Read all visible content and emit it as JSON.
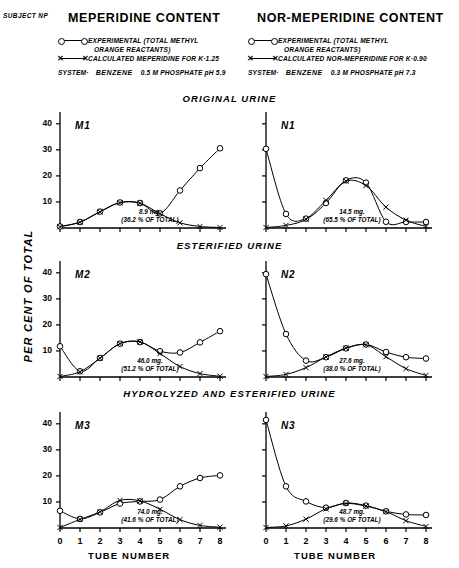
{
  "header": {
    "subject": "SUBJECT NP",
    "left_title": "MEPERIDINE CONTENT",
    "right_title": "NOR-MEPERIDINE CONTENT"
  },
  "legend_left": {
    "exp_line1": "EXPERIMENTAL (TOTAL METHYL",
    "exp_line2": "ORANGE REACTANTS)",
    "calc": "CALCULATED MEPERIDINE FOR K·1.25",
    "system_label": "SYSTEM·",
    "system_numerator": "BENZENE",
    "system_denominator": "0.5 M PHOSPHATE pH 5.9"
  },
  "legend_right": {
    "exp_line1": "EXPERIMENTAL (TOTAL METHYL",
    "exp_line2": "ORANGE REACTANTS)",
    "calc": "CALCULATED NOR-MEPERIDINE FOR K·0.90",
    "system_label": "SYSTEM·",
    "system_numerator": "BENZENE",
    "system_denominator": "0.3 M PHOSPHATE pH 7.3"
  },
  "sections": [
    "ORIGINAL URINE",
    "ESTERIFIED URINE",
    "HYDROLYZED AND ESTERIFIED URINE"
  ],
  "axes": {
    "ylabel": "PER CENT OF TOTAL",
    "xlabel": "TUBE NUMBER",
    "yticks": [
      "40",
      "30",
      "20",
      "10"
    ],
    "xticks": [
      "0",
      "1",
      "2",
      "3",
      "4",
      "5",
      "6",
      "7",
      "8"
    ]
  },
  "chart_data": {
    "type": "line",
    "xlabel": "TUBE NUMBER",
    "ylabel": "PER CENT OF TOTAL",
    "xlim": [
      0,
      8
    ],
    "ylim": [
      0,
      43
    ],
    "grid": false,
    "legend_position": "top",
    "panels": [
      {
        "id": "M1",
        "label": "M1",
        "column": "MEPERIDINE CONTENT",
        "row": "ORIGINAL URINE",
        "annotation_mg": "8.9 mg.",
        "annotation_pct": "(36.2 % OF TOTAL)",
        "x": [
          0,
          1,
          2,
          3,
          4,
          5,
          6,
          7,
          8
        ],
        "series": [
          {
            "name": "EXPERIMENTAL (TOTAL METHYL ORANGE REACTANTS)",
            "marker": "circle",
            "values": [
              0.6,
              2.3,
              6.3,
              9.8,
              9.6,
              5.6,
              14.4,
              23.0,
              30.6
            ]
          },
          {
            "name": "CALCULATED MEPERIDINE FOR K·1.25",
            "marker": "cross",
            "values": [
              0.5,
              2.2,
              6.2,
              9.7,
              9.5,
              5.5,
              2.0,
              0.6,
              0.2
            ]
          }
        ]
      },
      {
        "id": "N1",
        "label": "N1",
        "column": "NOR-MEPERIDINE CONTENT",
        "row": "ORIGINAL URINE",
        "annotation_mg": "14.5 mg.",
        "annotation_pct": "(65.5 % OF TOTAL)",
        "x": [
          0,
          1,
          2,
          3,
          4,
          5,
          6,
          7,
          8
        ],
        "series": [
          {
            "name": "EXPERIMENTAL (TOTAL METHYL ORANGE REACTANTS)",
            "marker": "circle",
            "values": [
              30.4,
              5.4,
              3.6,
              9.6,
              18.3,
              17.4,
              2.4,
              2.3,
              2.3
            ]
          },
          {
            "name": "CALCULATED NOR-MEPERIDINE FOR K·0.90",
            "marker": "cross",
            "values": [
              0.2,
              1.0,
              3.4,
              10.6,
              18.0,
              16.3,
              8.0,
              3.0,
              0.6
            ]
          }
        ]
      },
      {
        "id": "M2",
        "label": "M2",
        "column": "MEPERIDINE CONTENT",
        "row": "ESTERIFIED URINE",
        "annotation_mg": "46.0 mg.",
        "annotation_pct": "(51.2 % OF TOTAL)",
        "x": [
          0,
          1,
          2,
          3,
          4,
          5,
          6,
          7,
          8
        ],
        "series": [
          {
            "name": "EXPERIMENTAL (TOTAL METHYL ORANGE REACTANTS)",
            "marker": "circle",
            "values": [
              11.8,
              2.2,
              7.3,
              12.8,
              13.4,
              9.9,
              9.4,
              13.3,
              17.6
            ]
          },
          {
            "name": "CALCULATED MEPERIDINE FOR K·1.25",
            "marker": "cross",
            "values": [
              0.2,
              2.0,
              7.2,
              12.8,
              13.5,
              9.0,
              4.0,
              1.3,
              0.3
            ]
          }
        ]
      },
      {
        "id": "N2",
        "label": "N2",
        "column": "NOR-MEPERIDINE CONTENT",
        "row": "ESTERIFIED URINE",
        "annotation_mg": "27.6 mg.",
        "annotation_pct": "(38.0 % OF TOTAL)",
        "x": [
          0,
          1,
          2,
          3,
          4,
          5,
          6,
          7,
          8
        ],
        "series": [
          {
            "name": "EXPERIMENTAL (TOTAL METHYL ORANGE REACTANTS)",
            "marker": "circle",
            "values": [
              39.5,
              16.5,
              6.3,
              7.6,
              11.0,
              12.5,
              9.6,
              7.6,
              7.1
            ]
          },
          {
            "name": "CALCULATED NOR-MEPERIDINE FOR K·0.90",
            "marker": "cross",
            "values": [
              0.2,
              1.0,
              3.6,
              7.7,
              11.1,
              12.4,
              7.8,
              3.2,
              0.6
            ]
          }
        ]
      },
      {
        "id": "M3",
        "label": "M3",
        "column": "MEPERIDINE CONTENT",
        "row": "HYDROLYZED AND ESTERIFIED URINE",
        "annotation_mg": "74.0 mg.",
        "annotation_pct": "(41.6 % OF TOTAL)",
        "x": [
          0,
          1,
          2,
          3,
          4,
          5,
          6,
          7,
          8
        ],
        "series": [
          {
            "name": "EXPERIMENTAL (TOTAL METHYL ORANGE REACTANTS)",
            "marker": "circle",
            "values": [
              6.6,
              3.5,
              6.0,
              9.4,
              10.2,
              10.9,
              16.0,
              19.2,
              20.2
            ]
          },
          {
            "name": "CALCULATED MEPERIDINE FOR K·1.25",
            "marker": "cross",
            "values": [
              0.2,
              3.3,
              6.2,
              10.6,
              10.4,
              7.2,
              3.2,
              1.0,
              0.3
            ]
          }
        ]
      },
      {
        "id": "N3",
        "label": "N3",
        "column": "NOR-MEPERIDINE CONTENT",
        "row": "HYDROLYZED AND ESTERIFIED URINE",
        "annotation_mg": "48.7 mg.",
        "annotation_pct": "(29.6 % OF TOTAL)",
        "x": [
          0,
          1,
          2,
          3,
          4,
          5,
          6,
          7,
          8
        ],
        "series": [
          {
            "name": "EXPERIMENTAL (TOTAL METHYL ORANGE REACTANTS)",
            "marker": "circle",
            "values": [
              41.5,
              16.0,
              10.2,
              7.8,
              9.6,
              8.6,
              6.4,
              5.2,
              5.0
            ]
          },
          {
            "name": "CALCULATED NOR-MEPERIDINE FOR K·0.90",
            "marker": "cross",
            "values": [
              0.2,
              0.8,
              3.4,
              7.4,
              9.4,
              8.4,
              6.3,
              2.8,
              0.6
            ]
          }
        ]
      }
    ]
  }
}
